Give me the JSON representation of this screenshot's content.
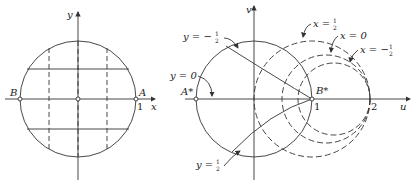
{
  "left_diagram": {
    "axis_x_label": "x",
    "axis_y_label": "y",
    "point_left_label": "B",
    "point_right_label": "A",
    "tick_label": "1"
  },
  "right_diagram": {
    "axis_u_label": "u",
    "axis_v_label": "v",
    "point_left_label": "A*",
    "point_right_label": "B*",
    "tick_1_label": "1",
    "tick_2_label": "2",
    "curve_labels": {
      "y_neg_half": "y = −",
      "y_zero": "y = 0",
      "y_pos_half": "y = ",
      "x_pos_half": "x = ",
      "x_zero": "x = 0",
      "x_neg_half": "x = −"
    },
    "frac_num": "1",
    "frac_den": "2"
  },
  "colors": {
    "line": "#333333",
    "background": "#ffffff"
  }
}
